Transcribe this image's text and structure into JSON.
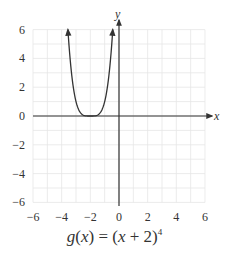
{
  "chart_data": {
    "type": "line",
    "function": "(x+2)^4",
    "xlabel": "x",
    "ylabel": "y",
    "xlim": [
      -6,
      6
    ],
    "ylim": [
      -6,
      6
    ],
    "x_ticks": [
      -6,
      -4,
      -2,
      0,
      2,
      4,
      6
    ],
    "y_ticks": [
      -6,
      -4,
      -2,
      0,
      2,
      4,
      6
    ],
    "grid": true,
    "grid_step": 1,
    "series": [
      {
        "name": "g(x)",
        "x": [
          -3.565,
          -3.4,
          -3.2,
          -3.0,
          -2.8,
          -2.6,
          -2.4,
          -2.2,
          -2.0,
          -1.8,
          -1.6,
          -1.4,
          -1.2,
          -1.0,
          -0.8,
          -0.6,
          -0.435
        ],
        "y": [
          6.0,
          3.84,
          2.07,
          1.0,
          0.41,
          0.13,
          0.03,
          0.0016,
          0,
          0.0016,
          0.03,
          0.13,
          0.41,
          1.0,
          2.07,
          3.84,
          6.0
        ],
        "arrows_at_ends": true,
        "vertex": [
          -2,
          0
        ]
      }
    ],
    "colors": {
      "curve": "#333333",
      "axis": "#333333",
      "grid": "#e6e6e6"
    }
  },
  "labels": {
    "x_axis": "x",
    "y_axis": "y",
    "x_ticks": [
      "−6",
      "−4",
      "−2",
      "0",
      "2",
      "4",
      "6"
    ],
    "y_ticks": [
      "6",
      "4",
      "2",
      "0",
      "−2",
      "−4",
      "−6"
    ]
  },
  "caption": {
    "fn": "g",
    "arg": "x",
    "eq": " = ",
    "lhs_open": "(",
    "lhs_close": ")",
    "rhs_var": "x",
    "rhs_rest": " + 2",
    "exponent": "4"
  }
}
